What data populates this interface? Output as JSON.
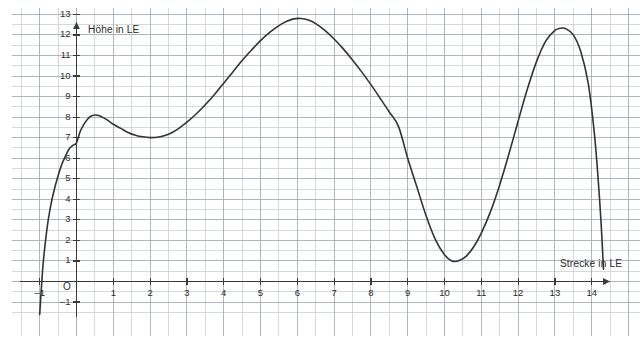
{
  "chart_data": {
    "type": "line",
    "title": "",
    "xlabel": "Strecke in LE",
    "ylabel": "Höhe in LE",
    "origin_label": "O",
    "xlim": [
      -1.4,
      15.0
    ],
    "ylim": [
      -1.6,
      13.6
    ],
    "grid": true,
    "grid_minor": true,
    "legend": "none",
    "xticks": [
      -1,
      1,
      2,
      3,
      4,
      5,
      6,
      7,
      8,
      9,
      10,
      11,
      12,
      13,
      14
    ],
    "xtick_labels": [
      "–1",
      "1",
      "2",
      "3",
      "4",
      "5",
      "6",
      "7",
      "8",
      "9",
      "10",
      "11",
      "12",
      "13",
      "14"
    ],
    "yticks": [
      -1,
      1,
      2,
      3,
      4,
      5,
      6,
      7,
      8,
      9,
      10,
      11,
      12,
      13
    ],
    "ytick_labels": [
      "–1",
      "1",
      "2",
      "3",
      "4",
      "5",
      "6",
      "7",
      "8",
      "9",
      "10",
      "11",
      "12",
      "13"
    ],
    "series": [
      {
        "name": "Höhenprofil",
        "color": "#333333",
        "x": [
          -1.0,
          -0.95,
          -0.9,
          -0.8,
          -0.7,
          -0.6,
          -0.5,
          -0.4,
          -0.3,
          -0.2,
          -0.1,
          0.0,
          0.1,
          0.2,
          0.3,
          0.4,
          0.5,
          0.6,
          0.7,
          0.8,
          0.9,
          1.0,
          1.2,
          1.4,
          1.6,
          1.8,
          2.0,
          2.2,
          2.4,
          2.6,
          2.8,
          3.0,
          3.25,
          3.5,
          3.75,
          4.0,
          4.25,
          4.5,
          4.75,
          5.0,
          5.25,
          5.5,
          5.7,
          5.9,
          6.1,
          6.3,
          6.5,
          6.75,
          7.0,
          7.25,
          7.5,
          7.75,
          8.0,
          8.25,
          8.5,
          8.75,
          9.0,
          9.25,
          9.5,
          9.75,
          10.0,
          10.2,
          10.4,
          10.6,
          10.8,
          11.0,
          11.25,
          11.5,
          11.75,
          12.0,
          12.25,
          12.5,
          12.75,
          13.0,
          13.15,
          13.3,
          13.5,
          13.7,
          13.9,
          14.05,
          14.15,
          14.25,
          14.32
        ],
        "y": [
          -1.6,
          -0.2,
          1.0,
          2.6,
          3.7,
          4.5,
          5.15,
          5.7,
          6.1,
          6.45,
          6.62,
          6.75,
          7.3,
          7.65,
          7.9,
          8.05,
          8.1,
          8.08,
          8.0,
          7.9,
          7.78,
          7.65,
          7.45,
          7.25,
          7.12,
          7.04,
          7.0,
          7.02,
          7.1,
          7.25,
          7.48,
          7.75,
          8.15,
          8.6,
          9.1,
          9.65,
          10.2,
          10.75,
          11.25,
          11.72,
          12.12,
          12.45,
          12.65,
          12.78,
          12.8,
          12.72,
          12.55,
          12.22,
          11.8,
          11.32,
          10.78,
          10.2,
          9.58,
          8.92,
          8.25,
          7.55,
          6.0,
          4.6,
          3.2,
          2.05,
          1.3,
          1.0,
          1.02,
          1.25,
          1.7,
          2.35,
          3.4,
          4.7,
          6.2,
          7.8,
          9.35,
          10.7,
          11.7,
          12.22,
          12.32,
          12.3,
          12.0,
          11.2,
          9.7,
          7.6,
          5.6,
          3.0,
          0.6
        ]
      }
    ],
    "annotations": {
      "local_max_1": {
        "x": 0.5,
        "y": 8.1
      },
      "local_min_1": {
        "x": 2.0,
        "y": 7.0
      },
      "global_max": {
        "x": 5.8,
        "y": 12.8
      },
      "global_min": {
        "x": 10.2,
        "y": 1.0
      },
      "local_max_2": {
        "x": 13.2,
        "y": 12.3
      }
    },
    "colors": {
      "curve": "#333333",
      "axis": "#3a3a3a",
      "grid_major": "#9aa4b0",
      "grid_minor": "#c9cfd6",
      "text": "#2b2b2b",
      "background": "#ffffff"
    }
  }
}
